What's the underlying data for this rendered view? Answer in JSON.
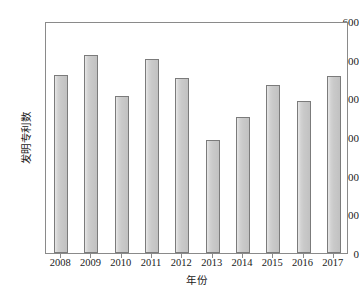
{
  "chart_data": {
    "type": "bar",
    "title": "",
    "subtitle": "",
    "xlabel": "年份",
    "ylabel": "发明专利数",
    "categories": [
      "2008",
      "2009",
      "2010",
      "2011",
      "2012",
      "2013",
      "2014",
      "2015",
      "2016",
      "2017"
    ],
    "values": [
      460,
      512,
      407,
      502,
      453,
      293,
      352,
      434,
      392,
      458
    ],
    "series": [
      {
        "name": "发明专利数",
        "values": [
          460,
          512,
          407,
          502,
          453,
          293,
          352,
          434,
          392,
          458
        ]
      }
    ],
    "ylim": [
      0,
      600
    ],
    "yticks": [
      0,
      100,
      200,
      300,
      400,
      500,
      600
    ],
    "ytick_labels": [
      "0",
      "100",
      "200",
      "300",
      "400",
      "500",
      "600"
    ],
    "xlim_categories": 10,
    "grid": false,
    "legend": false,
    "legend_position": "none",
    "bar_fill_color": "#c9c9c9",
    "bar_edge_color": "#7b7b7b",
    "axis_color": "#8a8a8a",
    "text_color": "#1a1a1a",
    "background_color": "#ffffff",
    "annotations": []
  }
}
